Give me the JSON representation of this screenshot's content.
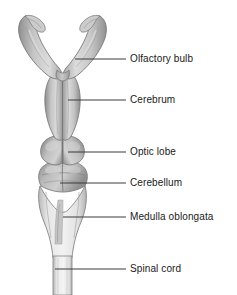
{
  "figure": {
    "background_color": "#ffffff",
    "leader_line_color": "#3a3a3a",
    "outline_color": "#6b6b6b",
    "tissue_fill_light": "#d8d8d8",
    "tissue_fill_mid": "#b4b4b4",
    "tissue_fill_dark": "#8f8f8f",
    "cord_fill": "#ebebeb"
  },
  "labels": [
    {
      "id": "olfactory-bulb",
      "text": "Olfactory bulb",
      "leader": {
        "x1": 75,
        "y1": 59,
        "x2": 126,
        "y2": 59
      }
    },
    {
      "id": "cerebrum",
      "text": "Cerebrum",
      "leader": {
        "x1": 68,
        "y1": 100,
        "x2": 126,
        "y2": 100
      }
    },
    {
      "id": "optic-lobe",
      "text": "Optic lobe",
      "leader": {
        "x1": 68,
        "y1": 152,
        "x2": 126,
        "y2": 152
      }
    },
    {
      "id": "cerebellum",
      "text": "Cerebellum",
      "leader": {
        "x1": 60,
        "y1": 183,
        "x2": 126,
        "y2": 183
      }
    },
    {
      "id": "medulla-oblongata",
      "text": "Medulla oblongata",
      "leader": {
        "x1": 63,
        "y1": 217,
        "x2": 126,
        "y2": 217
      }
    },
    {
      "id": "spinal-cord",
      "text": "Spinal cord",
      "leader": {
        "x1": 55,
        "y1": 269,
        "x2": 126,
        "y2": 269
      }
    }
  ]
}
